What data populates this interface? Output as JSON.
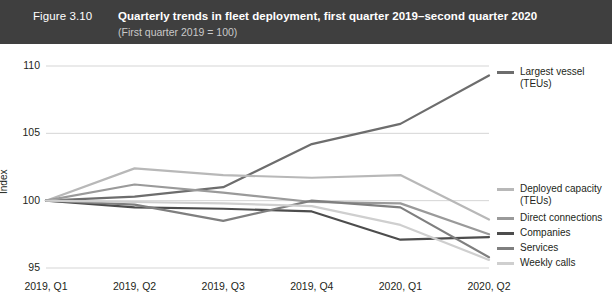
{
  "header": {
    "figure_number": "Figure 3.10",
    "title": "Quarterly trends in fleet deployment, first quarter 2019–second quarter 2020",
    "subtitle": "(First quarter 2019 = 100)",
    "band_color": "#3f3f3f",
    "title_color": "#ffffff",
    "subtitle_color": "#c9c9c9"
  },
  "chart_data": {
    "type": "line",
    "title": "Quarterly trends in fleet deployment, first quarter 2019–second quarter 2020",
    "subtitle": "(First quarter 2019 = 100)",
    "xlabel": "",
    "ylabel": "Index",
    "categories": [
      "2019, Q1",
      "2019, Q2",
      "2019, Q3",
      "2019, Q4",
      "2020, Q1",
      "2020, Q2"
    ],
    "ylim": [
      95,
      110
    ],
    "yticks": [
      95,
      100,
      105,
      110
    ],
    "grid": true,
    "legend_position": "right",
    "series": [
      {
        "name": "Largest vessel\n(TEUs)",
        "legend_label": "Largest vessel (TEUs)",
        "color": "#6d6d6d",
        "width": 2.2,
        "values": [
          100.0,
          100.3,
          101.0,
          104.2,
          105.7,
          109.3
        ]
      },
      {
        "name": "Deployed capacity\n(TEUs)",
        "legend_label": "Deployed capacity (TEUs)",
        "color": "#b8b8b8",
        "width": 2.2,
        "values": [
          100.0,
          102.4,
          101.9,
          101.7,
          101.9,
          98.6
        ]
      },
      {
        "name": "Direct connections",
        "legend_label": "Direct connections",
        "color": "#9a9a9a",
        "width": 2.2,
        "values": [
          100.0,
          101.2,
          100.6,
          99.9,
          99.8,
          97.5
        ]
      },
      {
        "name": "Companies",
        "legend_label": "Companies",
        "color": "#4d4d4d",
        "width": 2.2,
        "values": [
          100.0,
          99.5,
          99.4,
          99.2,
          97.1,
          97.3
        ]
      },
      {
        "name": "Services",
        "legend_label": "Services",
        "color": "#7f7f7f",
        "width": 2.2,
        "values": [
          100.0,
          99.7,
          98.5,
          100.0,
          99.5,
          95.8
        ]
      },
      {
        "name": "Weekly calls",
        "legend_label": "Weekly calls",
        "color": "#cfcfcf",
        "width": 2.2,
        "values": [
          100.0,
          99.9,
          99.8,
          99.6,
          98.2,
          95.6
        ]
      }
    ]
  },
  "legend": {
    "entries": [
      {
        "label": "Largest vessel\n(TEUs)",
        "color": "#6d6d6d",
        "top": 22
      },
      {
        "label": "Deployed capacity\n(TEUs)",
        "color": "#b8b8b8",
        "top": 139
      },
      {
        "label": "Direct connections",
        "color": "#9a9a9a",
        "top": 168
      },
      {
        "label": "Companies",
        "color": "#4d4d4d",
        "top": 183
      },
      {
        "label": "Services",
        "color": "#7f7f7f",
        "top": 198
      },
      {
        "label": "Weekly calls",
        "color": "#cfcfcf",
        "top": 213
      }
    ]
  }
}
